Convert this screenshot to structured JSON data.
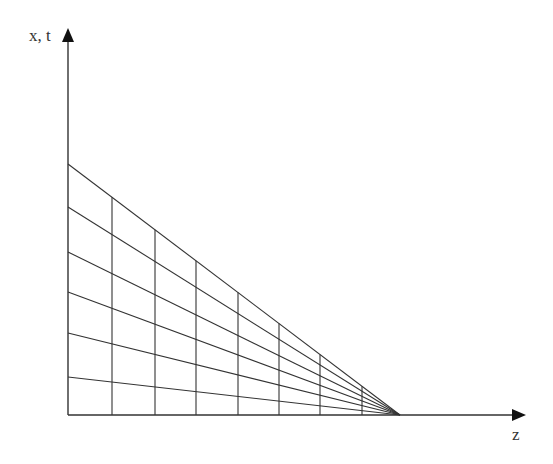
{
  "diagram": {
    "type": "perspective-grid",
    "axes": {
      "vertical_label": "x, t",
      "horizontal_label": "z",
      "origin": [
        68,
        415
      ],
      "vertical_arrow_tip": [
        68,
        28
      ],
      "horizontal_arrow_tip": [
        526,
        415
      ]
    },
    "vanishing_point": [
      400,
      415
    ],
    "converging_lines_y_intercepts": [
      164,
      207,
      252,
      292,
      333,
      377
    ],
    "vertical_lines_x": [
      112,
      155,
      196,
      238,
      279,
      320,
      362
    ],
    "colors": {
      "line": "#333333",
      "background": "#ffffff",
      "text": "#333333"
    }
  }
}
